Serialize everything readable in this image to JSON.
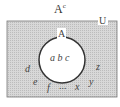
{
  "title": {
    "base": "A",
    "sup": "c"
  },
  "universe_label": "U",
  "set_label": "A",
  "inside_elements": "a b c",
  "outside_elements": {
    "d": "d",
    "e": "e",
    "f": "f",
    "dots": "...",
    "x": "x",
    "y": "y",
    "z": "z"
  },
  "colors": {
    "shade": "#cfcfcf",
    "stroke": "#555555",
    "circle_fill": "#ffffff"
  }
}
